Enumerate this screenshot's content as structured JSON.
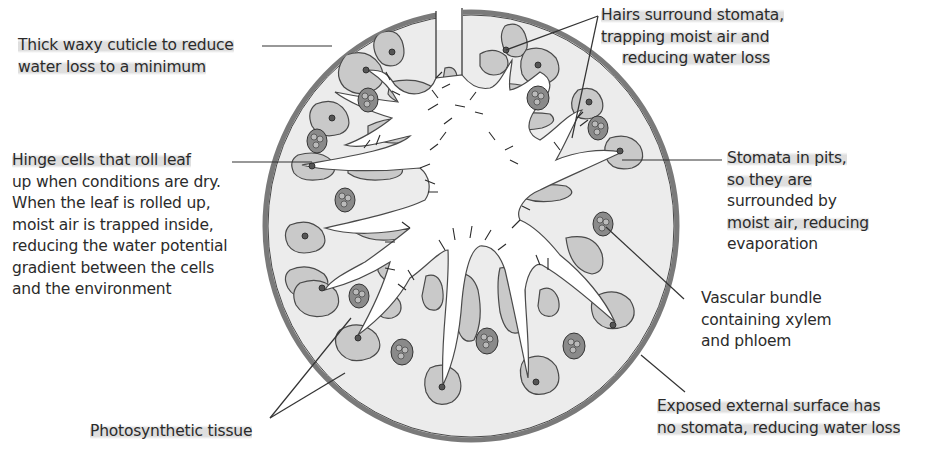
{
  "diagram": {
    "colors": {
      "background": "#ffffff",
      "leaf_fill": "#ececec",
      "cuticle": "#7a7a7a",
      "photosynthetic_tissue": "#c9c9c9",
      "air_space": "#ffffff",
      "outline": "#4a4a4a",
      "vascular_bundle": "#8a8a8a",
      "leader_line": "#333333"
    }
  },
  "labels": {
    "cuticle": {
      "lines": [
        "Thick waxy cuticle to reduce",
        "water loss to a minimum"
      ]
    },
    "hairs": {
      "lines": [
        "Hairs surround stomata,",
        "trapping moist air and",
        "reducing water loss"
      ]
    },
    "hinge_cells": {
      "lines": [
        "Hinge cells that roll leaf",
        "up when conditions are dry.",
        "When the leaf is rolled up,",
        "moist air is trapped inside,",
        "reducing the water potential",
        "gradient between the cells",
        "and the environment"
      ]
    },
    "stomata_pits": {
      "lines": [
        "Stomata in pits,",
        "so they are",
        "surrounded by",
        "moist air, reducing",
        "evaporation"
      ]
    },
    "vascular_bundle": {
      "lines": [
        "Vascular bundle",
        "containing xylem",
        "and phloem"
      ]
    },
    "photosynthetic_tissue": {
      "lines": [
        "Photosynthetic tissue"
      ]
    },
    "external_surface": {
      "lines": [
        "Exposed external surface has",
        "no stomata, reducing water loss"
      ]
    }
  }
}
